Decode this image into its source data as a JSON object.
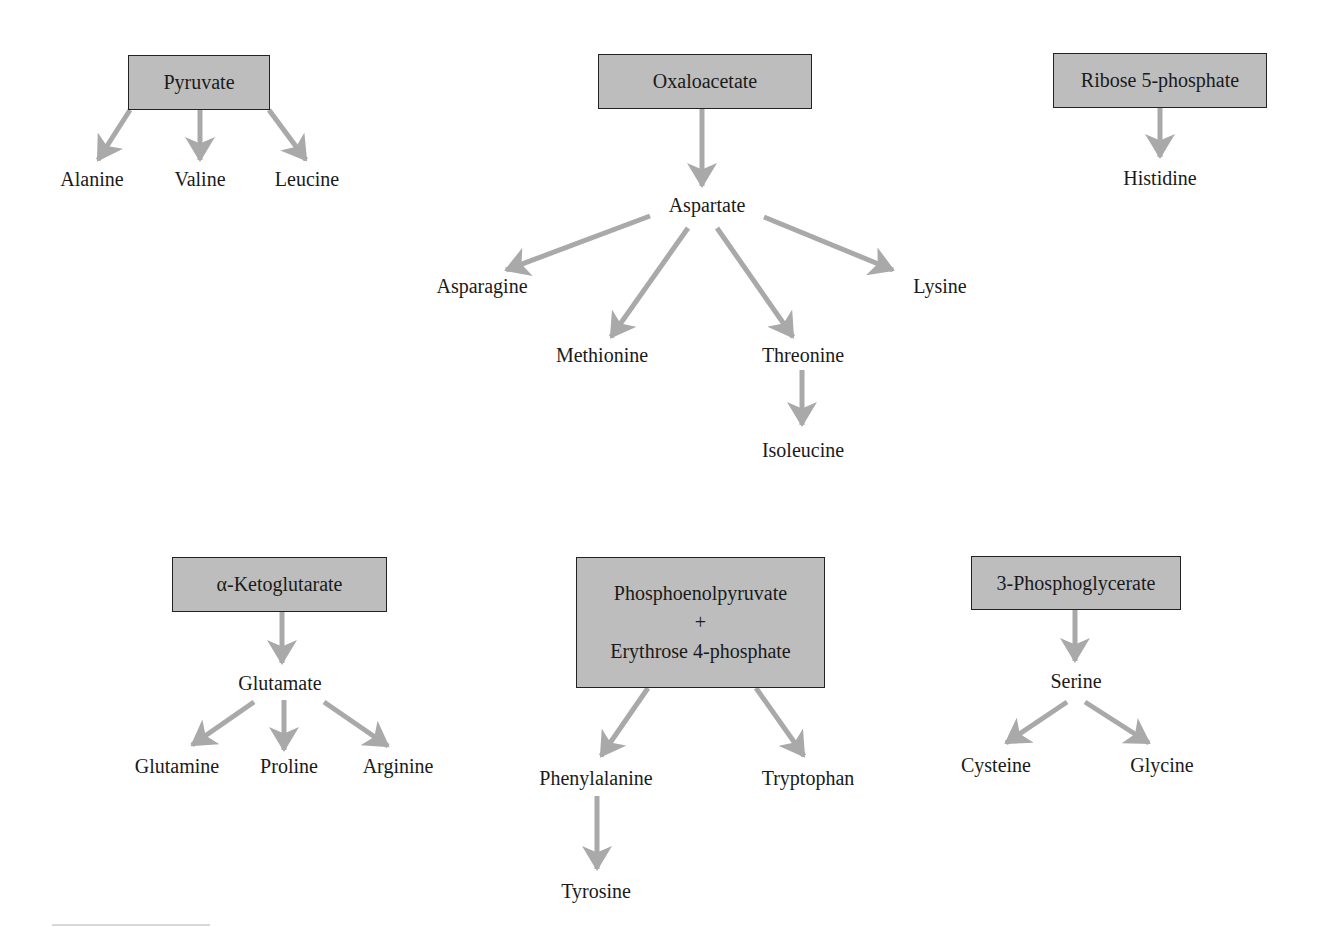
{
  "diagram": {
    "type": "biosynthetic-precursor-map",
    "arrow_color": "#a9a9a9",
    "box_fill": "#bdbdbd",
    "groups": [
      {
        "precursor": "Pyruvate",
        "products": [
          "Alanine",
          "Valine",
          "Leucine"
        ]
      },
      {
        "precursor": "Oxaloacetate",
        "intermediate": "Aspartate",
        "products": [
          "Asparagine",
          "Methionine",
          "Threonine",
          "Lysine"
        ],
        "threonine_product": "Isoleucine"
      },
      {
        "precursor": "Ribose 5-phosphate",
        "products": [
          "Histidine"
        ]
      },
      {
        "precursor": "α-Ketoglutarate",
        "intermediate": "Glutamate",
        "products": [
          "Glutamine",
          "Proline",
          "Arginine"
        ]
      },
      {
        "precursor_lines": [
          "Phosphoenolpyruvate",
          "+",
          "Erythrose 4-phosphate"
        ],
        "products": [
          "Phenylalanine",
          "Tryptophan"
        ],
        "phenylalanine_product": "Tyrosine"
      },
      {
        "precursor": "3-Phosphoglycerate",
        "intermediate": "Serine",
        "products": [
          "Cysteine",
          "Glycine"
        ]
      }
    ]
  }
}
